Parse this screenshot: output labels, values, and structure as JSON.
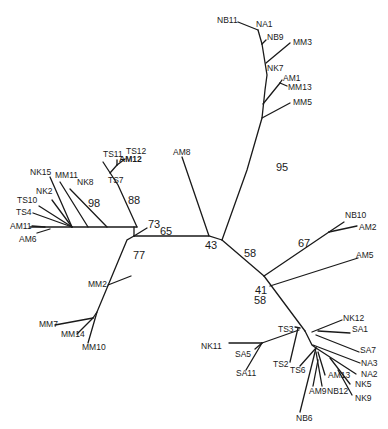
{
  "diagram": {
    "type": "unrooted phylogenetic tree",
    "bootstrap_values": [
      {
        "id": "b95",
        "value": "95",
        "x": 276,
        "y": 171
      },
      {
        "id": "b43",
        "value": "43",
        "x": 205,
        "y": 249
      },
      {
        "id": "b65",
        "value": "65",
        "x": 160,
        "y": 235
      },
      {
        "id": "b73",
        "value": "73",
        "x": 148,
        "y": 228
      },
      {
        "id": "b88",
        "value": "88",
        "x": 128,
        "y": 204
      },
      {
        "id": "b98",
        "value": "98",
        "x": 88,
        "y": 207
      },
      {
        "id": "b77",
        "value": "77",
        "x": 133,
        "y": 259
      },
      {
        "id": "b58a",
        "value": "58",
        "x": 244,
        "y": 257
      },
      {
        "id": "b67",
        "value": "67",
        "x": 298,
        "y": 247
      },
      {
        "id": "b41",
        "value": "41",
        "x": 255,
        "y": 294
      },
      {
        "id": "b58b",
        "value": "58",
        "x": 254,
        "y": 304
      }
    ],
    "taxa": [
      {
        "id": "NB11",
        "label": "NB11",
        "x": 217,
        "y": 23,
        "bold": false
      },
      {
        "id": "NA1",
        "label": "NA1",
        "x": 256,
        "y": 27,
        "bold": false
      },
      {
        "id": "NB9",
        "label": "NB9",
        "x": 267,
        "y": 40,
        "bold": false
      },
      {
        "id": "MM3",
        "label": "MM3",
        "x": 293,
        "y": 45,
        "bold": false
      },
      {
        "id": "NK7",
        "label": "NK7",
        "x": 267,
        "y": 71,
        "bold": false
      },
      {
        "id": "AM1",
        "label": "AM1",
        "x": 283,
        "y": 81,
        "bold": false
      },
      {
        "id": "MM13",
        "label": "MM13",
        "x": 288,
        "y": 90,
        "bold": false
      },
      {
        "id": "MM5",
        "label": "MM5",
        "x": 293,
        "y": 105,
        "bold": false
      },
      {
        "id": "AM8",
        "label": "AM8",
        "x": 173,
        "y": 155,
        "bold": false
      },
      {
        "id": "TS11",
        "label": "TS11",
        "x": 103,
        "y": 157,
        "bold": false
      },
      {
        "id": "TS12",
        "label": "TS12",
        "x": 126,
        "y": 154,
        "bold": false
      },
      {
        "id": "AM12",
        "label": "AM12",
        "x": 119,
        "y": 162,
        "bold": true
      },
      {
        "id": "TS7",
        "label": "TS7",
        "x": 108,
        "y": 183,
        "bold": false
      },
      {
        "id": "NK15",
        "label": "NK15",
        "x": 30,
        "y": 175,
        "bold": false
      },
      {
        "id": "MM11",
        "label": "MM11",
        "x": 55,
        "y": 178,
        "bold": false
      },
      {
        "id": "NK8",
        "label": "NK8",
        "x": 77,
        "y": 185,
        "bold": false
      },
      {
        "id": "NK2",
        "label": "NK2",
        "x": 36,
        "y": 194,
        "bold": false
      },
      {
        "id": "TS10",
        "label": "TS10",
        "x": 17,
        "y": 203,
        "bold": false
      },
      {
        "id": "TS4",
        "label": "TS4",
        "x": 16,
        "y": 215,
        "bold": false
      },
      {
        "id": "AM11",
        "label": "AM11",
        "x": 10,
        "y": 229,
        "bold": false
      },
      {
        "id": "AM6",
        "label": "AM6",
        "x": 19,
        "y": 242,
        "bold": false
      },
      {
        "id": "MM2",
        "label": "MM2",
        "x": 88,
        "y": 287,
        "bold": false
      },
      {
        "id": "MM7",
        "label": "MM7",
        "x": 39,
        "y": 327,
        "bold": false
      },
      {
        "id": "MM14",
        "label": "MM14",
        "x": 61,
        "y": 337,
        "bold": false
      },
      {
        "id": "MM10",
        "label": "MM10",
        "x": 82,
        "y": 350,
        "bold": false
      },
      {
        "id": "NB10",
        "label": "NB10",
        "x": 345,
        "y": 218,
        "bold": false
      },
      {
        "id": "AM2",
        "label": "AM2",
        "x": 359,
        "y": 230,
        "bold": false
      },
      {
        "id": "AM5",
        "label": "AM5",
        "x": 356,
        "y": 258,
        "bold": false
      },
      {
        "id": "NK12",
        "label": "NK12",
        "x": 343,
        "y": 321,
        "bold": false
      },
      {
        "id": "SA1",
        "label": "SA1",
        "x": 352,
        "y": 332,
        "bold": false
      },
      {
        "id": "TS3",
        "label": "TS3",
        "x": 278,
        "y": 332,
        "bold": false
      },
      {
        "id": "SA7",
        "label": "SA7",
        "x": 360,
        "y": 353,
        "bold": false
      },
      {
        "id": "NA3",
        "label": "NA3",
        "x": 361,
        "y": 366,
        "bold": false
      },
      {
        "id": "NA2",
        "label": "NA2",
        "x": 361,
        "y": 377,
        "bold": false
      },
      {
        "id": "NK5",
        "label": "NK5",
        "x": 355,
        "y": 387,
        "bold": false
      },
      {
        "id": "AM13",
        "label": "AM13",
        "x": 328,
        "y": 378,
        "bold": false
      },
      {
        "id": "NK9",
        "label": "NK9",
        "x": 355,
        "y": 401,
        "bold": false
      },
      {
        "id": "NK11",
        "label": "NK11",
        "x": 201,
        "y": 349,
        "bold": false
      },
      {
        "id": "SA5",
        "label": "SA5",
        "x": 235,
        "y": 357,
        "bold": false
      },
      {
        "id": "SA11",
        "label": "SA11",
        "x": 236,
        "y": 376,
        "bold": false
      },
      {
        "id": "TS2",
        "label": "TS2",
        "x": 273,
        "y": 367,
        "bold": false
      },
      {
        "id": "TS6",
        "label": "TS6",
        "x": 290,
        "y": 373,
        "bold": false
      },
      {
        "id": "AM9",
        "label": "AM9",
        "x": 309,
        "y": 394,
        "bold": false
      },
      {
        "id": "NB12",
        "label": "NB12",
        "x": 327,
        "y": 394,
        "bold": false
      },
      {
        "id": "NB6",
        "label": "NB6",
        "x": 296,
        "y": 421,
        "bold": false
      }
    ]
  }
}
